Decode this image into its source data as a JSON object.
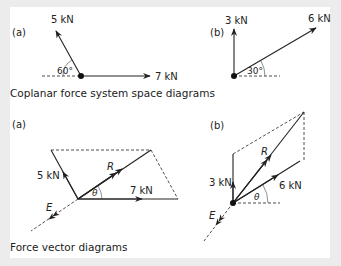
{
  "figure": {
    "colors": {
      "frame": "#ececec",
      "panel": "#ffffff",
      "ink": "#222222"
    },
    "space_diagrams": {
      "caption": "Coplanar force system space diagrams",
      "a": {
        "tag": "(a)",
        "force1": "5 kN",
        "force2": "7 kN",
        "angle": "60°"
      },
      "b": {
        "tag": "(b)",
        "force1": "3 kN",
        "force2": "6 kN",
        "angle": "30°"
      }
    },
    "vector_diagrams": {
      "caption": "Force vector diagrams",
      "a": {
        "tag": "(a)",
        "force1": "5 kN",
        "force2": "7 kN",
        "resultant": "R",
        "equilibrant": "E",
        "angle": "θ"
      },
      "b": {
        "tag": "(b)",
        "force1": "3 kN",
        "force2": "6 kN",
        "resultant": "R",
        "equilibrant": "E",
        "angle": "θ"
      }
    }
  }
}
